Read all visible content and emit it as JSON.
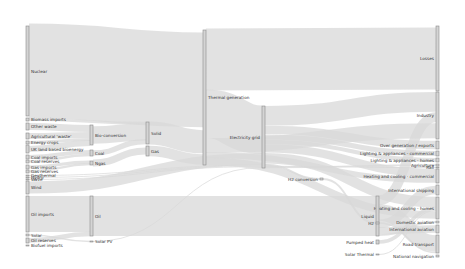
{
  "diagram": {
    "type": "sankey",
    "title": "",
    "colors": {
      "node_fill": "#d4d4d4",
      "node_stroke": "#8a8a8a",
      "link": "#d8d8d8",
      "text": "#333333",
      "background": "#ffffff"
    },
    "nodes": [
      {
        "id": "nuclear",
        "label": "Nuclear",
        "x": 26,
        "y": 26,
        "h": 90,
        "labelSide": "right"
      },
      {
        "id": "biomass_imports",
        "label": "Biomass imports",
        "x": 26,
        "y": 118,
        "h": 3,
        "labelSide": "right"
      },
      {
        "id": "other_waste",
        "label": "Other waste",
        "x": 26,
        "y": 123,
        "h": 7,
        "labelSide": "right"
      },
      {
        "id": "agri_waste",
        "label": "Agricultural 'waste'",
        "x": 26,
        "y": 133,
        "h": 6,
        "labelSide": "right"
      },
      {
        "id": "energy_crops",
        "label": "Energy crops",
        "x": 26,
        "y": 141,
        "h": 3,
        "labelSide": "right"
      },
      {
        "id": "uk_land_biomass",
        "label": "UK land based bioenergy",
        "x": 26,
        "y": 145,
        "h": 8,
        "labelSide": "right"
      },
      {
        "id": "coal_imports",
        "label": "Coal imports",
        "x": 26,
        "y": 155,
        "h": 4,
        "labelSide": "right"
      },
      {
        "id": "coal_reserves",
        "label": "Coal reserves",
        "x": 26,
        "y": 160,
        "h": 3,
        "labelSide": "right"
      },
      {
        "id": "gas_imports",
        "label": "Gas imports",
        "x": 26,
        "y": 165,
        "h": 4,
        "labelSide": "right"
      },
      {
        "id": "gas_reserves",
        "label": "Gas reserves",
        "x": 26,
        "y": 170,
        "h": 3,
        "labelSide": "right"
      },
      {
        "id": "geothermal",
        "label": "Geothermal",
        "x": 26,
        "y": 175,
        "h": 1,
        "labelSide": "right"
      },
      {
        "id": "hydro",
        "label": "Hydro",
        "x": 26,
        "y": 177,
        "h": 1,
        "labelSide": "right"
      },
      {
        "id": "wave",
        "label": "Wave",
        "x": 26,
        "y": 179,
        "h": 1,
        "labelSide": "right"
      },
      {
        "id": "wind",
        "label": "Wind",
        "x": 26,
        "y": 181,
        "h": 13,
        "labelSide": "right"
      },
      {
        "id": "oil_imports",
        "label": "Oil imports",
        "x": 26,
        "y": 196,
        "h": 36,
        "labelSide": "right"
      },
      {
        "id": "solar",
        "label": "Solar",
        "x": 26,
        "y": 234,
        "h": 2,
        "labelSide": "right"
      },
      {
        "id": "oil_reserves",
        "label": "Oil reserves",
        "x": 26,
        "y": 238,
        "h": 5,
        "labelSide": "right"
      },
      {
        "id": "biofuel_imports",
        "label": "Biofuel imports",
        "x": 26,
        "y": 245,
        "h": 1,
        "labelSide": "right"
      },
      {
        "id": "bio_conversion",
        "label": "Bio-conversion",
        "x": 90,
        "y": 125,
        "h": 20,
        "labelSide": "right"
      },
      {
        "id": "coal",
        "label": "Coal",
        "x": 90,
        "y": 150,
        "h": 6,
        "labelSide": "right"
      },
      {
        "id": "ngas",
        "label": "Ngas",
        "x": 90,
        "y": 161,
        "h": 4,
        "labelSide": "right"
      },
      {
        "id": "oil",
        "label": "Oil",
        "x": 90,
        "y": 196,
        "h": 40,
        "labelSide": "right"
      },
      {
        "id": "solar_pv",
        "label": "Solar PV",
        "x": 90,
        "y": 241,
        "h": 1,
        "labelSide": "right"
      },
      {
        "id": "solid",
        "label": "Solid",
        "x": 146,
        "y": 122,
        "h": 22,
        "labelSide": "right"
      },
      {
        "id": "gas",
        "label": "Gas",
        "x": 146,
        "y": 146,
        "h": 10,
        "labelSide": "right"
      },
      {
        "id": "thermal_generation",
        "label": "Thermal generation",
        "x": 203,
        "y": 30,
        "h": 135,
        "labelSide": "right"
      },
      {
        "id": "electricity_grid",
        "label": "Electricity grid",
        "x": 262,
        "y": 106,
        "h": 62,
        "labelSide": "left"
      },
      {
        "id": "h2_conversion",
        "label": "H2 conversion",
        "x": 320,
        "y": 178,
        "h": 2,
        "labelSide": "left"
      },
      {
        "id": "over_generation",
        "label": "Over generation / exports",
        "x": 436,
        "y": 141,
        "h": 8,
        "labelSide": "left"
      },
      {
        "id": "lighting_commercial",
        "label": "Lighting & appliances - commercial",
        "x": 436,
        "y": 151,
        "h": 5,
        "labelSide": "left"
      },
      {
        "id": "lighting_homes",
        "label": "Lighting & appliances - homes",
        "x": 436,
        "y": 158,
        "h": 4,
        "labelSide": "left"
      },
      {
        "id": "agriculture",
        "label": "Agriculture",
        "x": 436,
        "y": 164,
        "h": 2,
        "labelSide": "left"
      },
      {
        "id": "rail",
        "label": "Rail",
        "x": 436,
        "y": 167,
        "h": 1,
        "labelSide": "left"
      },
      {
        "id": "heating_commercial",
        "label": "Heating and cooling - commercial",
        "x": 436,
        "y": 169,
        "h": 14,
        "labelSide": "left"
      },
      {
        "id": "intl_shipping",
        "label": "International shipping",
        "x": 436,
        "y": 185,
        "h": 10,
        "labelSide": "left"
      },
      {
        "id": "heating_homes",
        "label": "Heating and cooling - homes",
        "x": 436,
        "y": 197,
        "h": 22,
        "labelSide": "left"
      },
      {
        "id": "domestic_aviation",
        "label": "Domestic aviation",
        "x": 436,
        "y": 221,
        "h": 2,
        "labelSide": "left"
      },
      {
        "id": "intl_aviation",
        "label": "International aviation",
        "x": 436,
        "y": 225,
        "h": 8,
        "labelSide": "left"
      },
      {
        "id": "road_transport",
        "label": "Road transport",
        "x": 436,
        "y": 235,
        "h": 18,
        "labelSide": "left"
      },
      {
        "id": "national_navigation",
        "label": "National navigation",
        "x": 436,
        "y": 255,
        "h": 2,
        "labelSide": "left"
      },
      {
        "id": "losses",
        "label": "Losses",
        "x": 436,
        "y": 26,
        "h": 65,
        "labelSide": "left"
      },
      {
        "id": "industry",
        "label": "Industry",
        "x": 436,
        "y": 92,
        "h": 47,
        "labelSide": "left"
      },
      {
        "id": "liquid",
        "label": "Liquid",
        "x": 376,
        "y": 196,
        "h": 40,
        "labelSide": "left"
      },
      {
        "id": "h2",
        "label": "H2",
        "x": 376,
        "y": 222,
        "h": 2,
        "labelSide": "left"
      },
      {
        "id": "pumped_heat",
        "label": "Pumped heat",
        "x": 376,
        "y": 240,
        "h": 4,
        "labelSide": "left"
      },
      {
        "id": "solar_thermal",
        "label": "Solar Thermal",
        "x": 376,
        "y": 254,
        "h": 1,
        "labelSide": "left"
      }
    ],
    "links": [
      [
        "nuclear",
        "thermal_generation",
        90
      ],
      [
        "biomass_imports",
        "solid",
        3
      ],
      [
        "other_waste",
        "bio_conversion",
        7
      ],
      [
        "agri_waste",
        "bio_conversion",
        6
      ],
      [
        "energy_crops",
        "bio_conversion",
        3
      ],
      [
        "uk_land_biomass",
        "bio_conversion",
        4
      ],
      [
        "bio_conversion",
        "solid",
        19
      ],
      [
        "coal_imports",
        "coal",
        4
      ],
      [
        "coal_reserves",
        "coal",
        2
      ],
      [
        "coal",
        "solid",
        6
      ],
      [
        "gas_imports",
        "ngas",
        4
      ],
      [
        "gas_reserves",
        "ngas",
        3
      ],
      [
        "ngas",
        "gas",
        4
      ],
      [
        "solid",
        "thermal_generation",
        22
      ],
      [
        "gas",
        "thermal_generation",
        10
      ],
      [
        "thermal_generation",
        "losses",
        65
      ],
      [
        "thermal_generation",
        "electricity_grid",
        55
      ],
      [
        "wind",
        "electricity_grid",
        13
      ],
      [
        "geothermal",
        "electricity_grid",
        1
      ],
      [
        "hydro",
        "electricity_grid",
        1
      ],
      [
        "wave",
        "electricity_grid",
        1
      ],
      [
        "solar",
        "solar_pv",
        1
      ],
      [
        "solar_pv",
        "electricity_grid",
        1
      ],
      [
        "electricity_grid",
        "industry",
        18
      ],
      [
        "electricity_grid",
        "over_generation",
        8
      ],
      [
        "electricity_grid",
        "lighting_commercial",
        5
      ],
      [
        "electricity_grid",
        "lighting_homes",
        4
      ],
      [
        "electricity_grid",
        "heating_commercial",
        8
      ],
      [
        "electricity_grid",
        "heating_homes",
        10
      ],
      [
        "electricity_grid",
        "h2_conversion",
        2
      ],
      [
        "electricity_grid",
        "rail",
        1
      ],
      [
        "electricity_grid",
        "agriculture",
        1
      ],
      [
        "oil_imports",
        "oil",
        36
      ],
      [
        "oil_reserves",
        "oil",
        4
      ],
      [
        "oil",
        "liquid",
        40
      ],
      [
        "liquid",
        "industry",
        10
      ],
      [
        "liquid",
        "road_transport",
        18
      ],
      [
        "liquid",
        "intl_shipping",
        8
      ],
      [
        "liquid",
        "intl_aviation",
        8
      ],
      [
        "liquid",
        "domestic_aviation",
        2
      ],
      [
        "h2_conversion",
        "h2",
        2
      ],
      [
        "h2",
        "road_transport",
        1
      ],
      [
        "pumped_heat",
        "heating_homes",
        3
      ],
      [
        "solar_thermal",
        "heating_homes",
        1
      ],
      [
        "thermal_generation",
        "industry",
        15
      ],
      [
        "thermal_generation",
        "heating_commercial",
        6
      ],
      [
        "thermal_generation",
        "heating_homes",
        8
      ]
    ]
  }
}
